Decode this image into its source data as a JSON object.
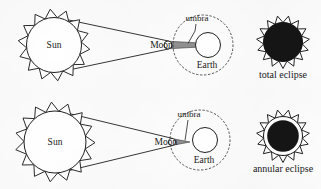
{
  "figure": {
    "background_color": "#fcfcfc",
    "ink_color": "#1a1a1a",
    "shadow_color": "#8c8c8c",
    "eclipse_disk_color": "#151515"
  },
  "rows": [
    {
      "id": "total",
      "sun": {
        "label": "Sun",
        "ray_count": 14,
        "core_radius": 27.5,
        "ray_length": 8.5,
        "cx": 54,
        "cy": 45
      },
      "moon": {
        "label": "Moon",
        "radius": 4.0,
        "cx": 168,
        "cy": 45
      },
      "earth": {
        "label": "Earth",
        "radius": 12.5,
        "cx": 208,
        "cy": 45
      },
      "orbit": {
        "radius": 30,
        "cx": 203,
        "cy": 45,
        "style": "dashed"
      },
      "umbra": {
        "label": "umbra",
        "reaches_earth": true,
        "tip_x": 196,
        "leader_from_x": 196,
        "leader_from_y": 22
      },
      "eclipse_icon": {
        "type": "total",
        "inner_fill": "#151515",
        "ring": false,
        "cx": 283,
        "cy": 42,
        "disk_radius": 20,
        "ray_count": 15,
        "ray_length": 7
      },
      "caption": "total eclipse"
    },
    {
      "id": "annular",
      "sun": {
        "label": "Sun",
        "ray_count": 15,
        "core_radius": 31,
        "ray_length": 9,
        "cx": 55,
        "cy": 142
      },
      "moon": {
        "label": "Moon",
        "radius": 3.6,
        "cx": 172,
        "cy": 142
      },
      "earth": {
        "label": "Earth",
        "radius": 12.5,
        "cx": 205,
        "cy": 140
      },
      "orbit": {
        "radius": 30,
        "cx": 200,
        "cy": 140,
        "style": "dashed"
      },
      "umbra": {
        "label": "umbra",
        "reaches_earth": false,
        "tip_x": 190,
        "leader_from_x": 188,
        "leader_from_y": 118
      },
      "eclipse_icon": {
        "type": "annular",
        "inner_fill": "#151515",
        "ring": true,
        "cx": 283,
        "cy": 136,
        "disk_radius": 20,
        "ray_count": 15,
        "ray_length": 7
      },
      "caption": "annular eclipse"
    }
  ]
}
